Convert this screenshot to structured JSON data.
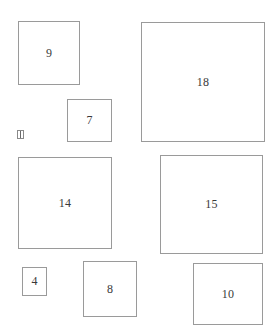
{
  "diagram": {
    "top_text": "",
    "boxes": [
      {
        "label": "9",
        "x": 18,
        "y": 21,
        "w": 62,
        "h": 64
      },
      {
        "label": "18",
        "x": 141,
        "y": 22,
        "w": 124,
        "h": 120
      },
      {
        "label": "7",
        "x": 67,
        "y": 99,
        "w": 45,
        "h": 43
      },
      {
        "label": "14",
        "x": 18,
        "y": 157,
        "w": 94,
        "h": 92
      },
      {
        "label": "15",
        "x": 160,
        "y": 155,
        "w": 103,
        "h": 99
      },
      {
        "label": "4",
        "x": 22,
        "y": 267,
        "w": 25,
        "h": 29
      },
      {
        "label": "8",
        "x": 83,
        "y": 261,
        "w": 54,
        "h": 56
      },
      {
        "label": "10",
        "x": 193,
        "y": 263,
        "w": 70,
        "h": 62
      }
    ],
    "glyph_icon": "bracket-box-glyph"
  }
}
